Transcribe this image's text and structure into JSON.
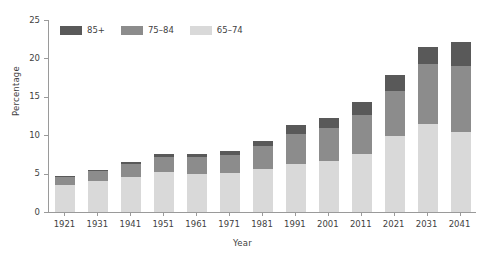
{
  "chart_data": {
    "type": "bar",
    "stacked": true,
    "title": "",
    "xlabel": "Year",
    "ylabel": "Percentage",
    "ylim": [
      0,
      25
    ],
    "yticks": [
      0,
      5,
      10,
      15,
      20,
      25
    ],
    "grid": false,
    "legend_position": "top-left",
    "categories": [
      "1921",
      "1931",
      "1941",
      "1951",
      "1961",
      "1971",
      "1981",
      "1991",
      "2001",
      "2011",
      "2021",
      "2031",
      "2041"
    ],
    "series": [
      {
        "name": "65–74",
        "color": "#d9d9d9",
        "values": [
          3.5,
          4.1,
          4.6,
          5.2,
          5.0,
          5.1,
          5.6,
          6.3,
          6.6,
          7.6,
          9.9,
          11.5,
          10.4
        ]
      },
      {
        "name": "75–84",
        "color": "#8c8c8c",
        "values": [
          1.0,
          1.2,
          1.6,
          2.0,
          2.1,
          2.3,
          3.0,
          3.9,
          4.3,
          5.0,
          5.9,
          7.8,
          8.6
        ]
      },
      {
        "name": "85+",
        "color": "#595959",
        "values": [
          0.2,
          0.2,
          0.3,
          0.4,
          0.4,
          0.5,
          0.7,
          1.1,
          1.3,
          1.7,
          2.0,
          2.2,
          3.2
        ]
      }
    ],
    "totals": [
      4.7,
      5.5,
      6.5,
      7.6,
      7.5,
      7.9,
      9.3,
      11.3,
      12.2,
      14.3,
      17.8,
      21.5,
      22.2
    ]
  },
  "legend": {
    "items": [
      {
        "label": "85+",
        "color": "#595959"
      },
      {
        "label": "75–84",
        "color": "#8c8c8c"
      },
      {
        "label": "65–74",
        "color": "#d9d9d9"
      }
    ]
  },
  "axes": {
    "y_title": "Percentage",
    "x_title": "Year"
  },
  "colors": {
    "axis": "#9a9a9a",
    "text": "#3f3f3f",
    "background": "#ffffff"
  }
}
